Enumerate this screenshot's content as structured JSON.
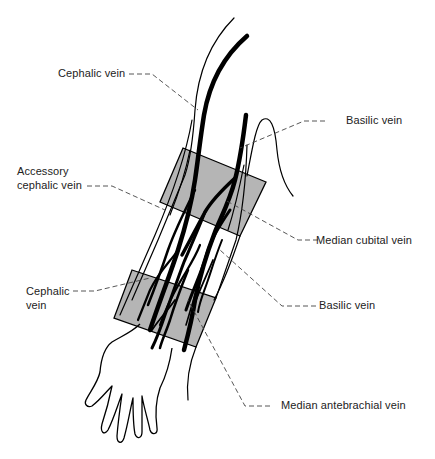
{
  "diagram": {
    "colors": {
      "background": "#ffffff",
      "vein": "#000000",
      "outline": "#000000",
      "highlight_band": "#b5b5b5",
      "leader_line": "#444444",
      "label_text": "#222222"
    },
    "bands": [
      {
        "name": "upper-band",
        "region": "antecubital fossa"
      },
      {
        "name": "lower-band",
        "region": "distal forearm"
      }
    ],
    "labels": [
      {
        "id": "cephalic_upper",
        "text": "Cephalic vein",
        "side": "left"
      },
      {
        "id": "basilic_upper",
        "text": "Basilic vein",
        "side": "right"
      },
      {
        "id": "accessory_cephalic",
        "line1": "Accessory",
        "line2": "cephalic vein",
        "side": "left"
      },
      {
        "id": "median_cubital",
        "text": "Median cubital vein",
        "side": "right"
      },
      {
        "id": "cephalic_lower",
        "line1": "Cephalic",
        "line2": "vein",
        "side": "left"
      },
      {
        "id": "basilic_lower",
        "text": "Basilic vein",
        "side": "right"
      },
      {
        "id": "median_antebrachial",
        "text": "Median antebrachial vein",
        "side": "right"
      }
    ]
  }
}
